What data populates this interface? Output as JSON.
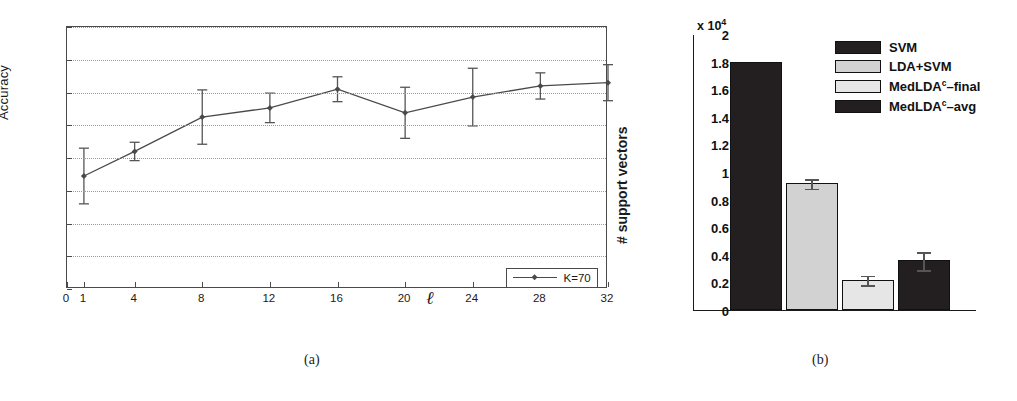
{
  "figure": {
    "caption_a": "(a)",
    "caption_b": "(b)"
  },
  "chart_data": [
    {
      "id": "panel-a",
      "type": "line",
      "title": "",
      "xlabel": "ℓ",
      "ylabel": "Accuracy",
      "xlim": [
        0,
        32
      ],
      "ylim": [
        0.72,
        0.8
      ],
      "grid": true,
      "legend_position": "bottom-right",
      "xticks": [
        0,
        1,
        4,
        8,
        12,
        16,
        20,
        24,
        28,
        32
      ],
      "xtick_labels": [
        "0",
        "1",
        "4",
        "8",
        "12",
        "16",
        "20",
        "24",
        "28",
        "32"
      ],
      "yticks": [
        0.72,
        0.73,
        0.74,
        0.75,
        0.76,
        0.77,
        0.78,
        0.79,
        0.8
      ],
      "ytick_labels": [
        "0.72",
        "0.73",
        "0.74",
        "0.75",
        "0.76",
        "0.77",
        "0.78",
        "0.79",
        "0.8"
      ],
      "series": [
        {
          "name": "K=70",
          "marker": "diamond",
          "x": [
            1,
            4,
            8,
            12,
            16,
            20,
            24,
            28,
            32
          ],
          "values": [
            0.7545,
            0.762,
            0.7725,
            0.7753,
            0.781,
            0.7738,
            0.7786,
            0.782,
            0.783
          ],
          "errors": [
            0.0085,
            0.0028,
            0.0083,
            0.0045,
            0.0038,
            0.0078,
            0.0088,
            0.004,
            0.0055
          ]
        }
      ]
    },
    {
      "id": "panel-b",
      "type": "bar",
      "title": "",
      "xlabel": "",
      "ylabel": "# support vectors",
      "y_exponent": "x 10",
      "y_exponent_sup": "4",
      "ylim": [
        0,
        2
      ],
      "grid": false,
      "legend_position": "top-right",
      "yticks": [
        0,
        0.2,
        0.4,
        0.6,
        0.8,
        1,
        1.2,
        1.4,
        1.6,
        1.8,
        2
      ],
      "ytick_labels": [
        "0",
        "0.2",
        "0.4",
        "0.6",
        "0.8",
        "1",
        "1.2",
        "1.4",
        "1.6",
        "1.8",
        "2"
      ],
      "categories": [
        "SVM",
        "LDA+SVM",
        "MedLDAᶜ–final",
        "MedLDAᶜ–avg"
      ],
      "values": [
        1.8,
        0.92,
        0.22,
        0.36
      ],
      "errors": [
        0.0,
        0.035,
        0.035,
        0.065
      ],
      "colors": [
        "#231f20",
        "#d2d2d2",
        "#e6e6e6",
        "#231f20"
      ],
      "legend": [
        {
          "label_main": "SVM",
          "label_sup": "",
          "label_tail": "",
          "color": "#231f20"
        },
        {
          "label_main": "LDA+SVM",
          "label_sup": "",
          "label_tail": "",
          "color": "#d2d2d2"
        },
        {
          "label_main": "MedLDA",
          "label_sup": "c",
          "label_tail": "–final",
          "color": "#e6e6e6"
        },
        {
          "label_main": "MedLDA",
          "label_sup": "c",
          "label_tail": "–avg",
          "color": "#231f20"
        }
      ]
    }
  ]
}
